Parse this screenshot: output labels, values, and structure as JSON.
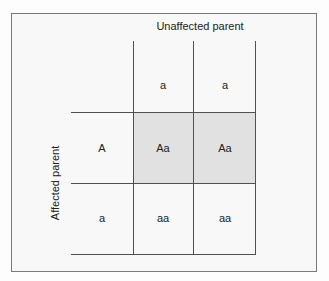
{
  "diagram": {
    "type": "punnett-square",
    "column_header_title": "Unaffected parent",
    "row_header_title": "Affected parent",
    "column_alleles": [
      "a",
      "a"
    ],
    "row_alleles": [
      "A",
      "a"
    ],
    "cells": [
      [
        "Aa",
        "Aa"
      ],
      [
        "aa",
        "aa"
      ]
    ],
    "highlighted_row": 0,
    "colors": {
      "highlight_fill": "#e1e1e1",
      "grid_line": "#505050",
      "frame_border": "#7a7a7a",
      "background": "#f8f8f8"
    }
  }
}
